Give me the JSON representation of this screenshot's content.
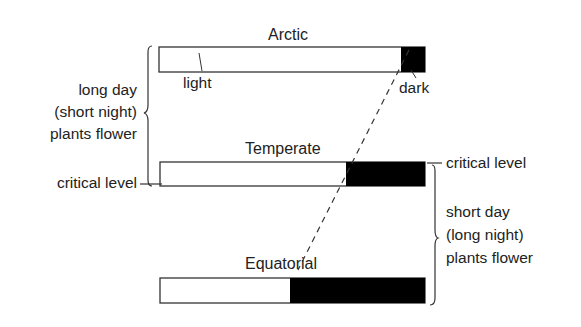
{
  "diagram": {
    "zones": [
      {
        "name": "Arctic",
        "light_fraction": 0.91,
        "dark_fraction": 0.09
      },
      {
        "name": "Temperate",
        "light_fraction": 0.7,
        "dark_fraction": 0.3
      },
      {
        "name": "Equatorial",
        "light_fraction": 0.49,
        "dark_fraction": 0.51
      }
    ],
    "labels": {
      "light": "light",
      "dark": "dark",
      "critical_left": "critical level",
      "critical_right": "critical level",
      "long_day": [
        "long day",
        "(short night)",
        "plants flower"
      ],
      "short_day": [
        "short day",
        "(long night)",
        "plants flower"
      ]
    },
    "colors": {
      "dark": "#000000",
      "light": "#ffffff",
      "stroke": "#333333"
    }
  }
}
